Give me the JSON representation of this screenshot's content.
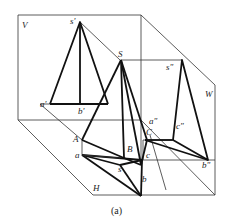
{
  "figure": {
    "caption": "(a)",
    "planes": {
      "V": "V",
      "H": "H",
      "W": "W"
    },
    "points_space": {
      "S": "S",
      "A": "A",
      "B": "B",
      "C": "C"
    },
    "points_V": {
      "s": "s'",
      "a": "a'",
      "b": "b'"
    },
    "points_W": {
      "s": "s\"",
      "a": "a\"",
      "c": "c\"",
      "b": "b\""
    },
    "points_H": {
      "a": "a",
      "s": "s",
      "c": "c",
      "b": "b"
    }
  }
}
